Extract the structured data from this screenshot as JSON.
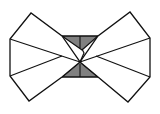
{
  "figure": {
    "colors": {
      "background": "#ffffff",
      "stroke": "#111111",
      "panel_fill": "#ffffff",
      "shade_fill": "#808080"
    },
    "left_wing": {
      "outline": [
        [
          31,
          13
        ],
        [
          10,
          39
        ],
        [
          10,
          76
        ],
        [
          29,
          101
        ],
        [
          62,
          77
        ],
        [
          80,
          62
        ],
        [
          62,
          36
        ]
      ],
      "creases": [
        [
          [
            10,
            39
          ],
          [
            80,
            62
          ]
        ],
        [
          [
            10,
            76
          ],
          [
            62,
            56
          ]
        ]
      ]
    },
    "right_wing": {
      "outline": [
        [
          130,
          12
        ],
        [
          150,
          38
        ],
        [
          150,
          77
        ],
        [
          128,
          102
        ],
        [
          98,
          77
        ],
        [
          80,
          62
        ],
        [
          98,
          36
        ]
      ],
      "creases": [
        [
          [
            150,
            38
          ],
          [
            80,
            62
          ]
        ],
        [
          [
            150,
            77
          ],
          [
            96,
            56
          ]
        ]
      ]
    },
    "top_triangle": {
      "points": [
        [
          62,
          36
        ],
        [
          98,
          36
        ],
        [
          82,
          50
        ]
      ],
      "center_line": [
        [
          80,
          36
        ],
        [
          80,
          48
        ]
      ]
    },
    "bottom_triangle": {
      "points": [
        [
          80,
          62
        ],
        [
          62,
          77
        ],
        [
          98,
          77
        ]
      ],
      "center_line": [
        [
          80,
          64
        ],
        [
          80,
          77
        ]
      ]
    },
    "center_zigzag": [
      [
        82,
        49
      ],
      [
        84,
        53
      ],
      [
        80,
        62
      ]
    ]
  }
}
